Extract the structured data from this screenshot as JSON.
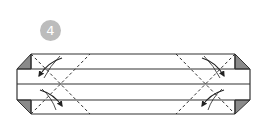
{
  "step": {
    "number": "4",
    "badge_color": "#bcbcbc",
    "badge_text_color": "#ffffff"
  },
  "diagram": {
    "line_color": "#333333",
    "shade_color": "#8a8a8a",
    "horizontal_lines_y": [
      54,
      69,
      84,
      100,
      114
    ],
    "left_tip_x": 17,
    "right_tip_x": 250,
    "left_corner_x": 31,
    "right_corner_x": 235,
    "arrows": [
      {
        "position": "left-upper",
        "direction": "down-left"
      },
      {
        "position": "left-lower",
        "direction": "down-right"
      },
      {
        "position": "right-upper",
        "direction": "down-right"
      },
      {
        "position": "right-lower",
        "direction": "down-left"
      }
    ]
  }
}
